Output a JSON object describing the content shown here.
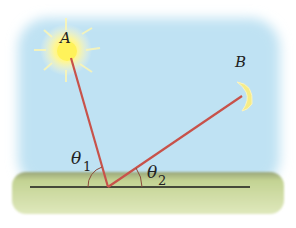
{
  "diagram": {
    "points": {
      "A": {
        "label": "A",
        "object": "sun"
      },
      "B": {
        "label": "B",
        "object": "crescent-moon"
      }
    },
    "angles": [
      {
        "symbol": "θ",
        "subscript": "1",
        "between": "horizon-left and ray to A"
      },
      {
        "symbol": "θ",
        "subscript": "2",
        "between": "horizon-right and ray to B"
      }
    ],
    "colors": {
      "sky": "#bfe2f3",
      "ground": "#c9d99a",
      "ray": "#c8524a",
      "horizon": "#1a1a1a",
      "arc": "#8a4a3a",
      "sun": "#fff36a",
      "moon": "#f7ec8a"
    }
  }
}
